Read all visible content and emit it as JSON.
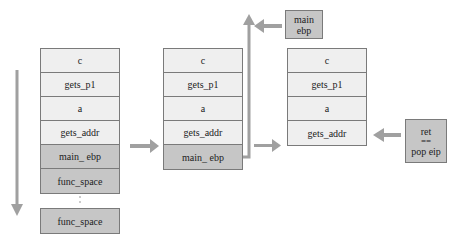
{
  "diagram": {
    "stack1": {
      "cells": [
        {
          "label": "c",
          "shade": "light"
        },
        {
          "label": "gets_p1",
          "shade": "light"
        },
        {
          "label": "a",
          "shade": "light"
        },
        {
          "label": "gets_addr",
          "shade": "light"
        },
        {
          "label": "main_ ebp",
          "shade": "dark"
        },
        {
          "label": "func_space",
          "shade": "dark"
        }
      ],
      "ellipsis": "⋮",
      "bottom_cell": "func_space"
    },
    "stack2": {
      "cells": [
        {
          "label": "c",
          "shade": "light"
        },
        {
          "label": "gets_p1",
          "shade": "light"
        },
        {
          "label": "a",
          "shade": "light"
        },
        {
          "label": "gets_addr",
          "shade": "light"
        },
        {
          "label": "main_ ebp",
          "shade": "dark"
        }
      ]
    },
    "stack3": {
      "cells": [
        {
          "label": "c",
          "shade": "light"
        },
        {
          "label": "gets_p1",
          "shade": "light"
        },
        {
          "label": "a",
          "shade": "light"
        },
        {
          "label": "gets_addr",
          "shade": "light"
        }
      ]
    },
    "popped_box": {
      "line1": "main",
      "line2": "ebp"
    },
    "ret_box": {
      "line1": "ret",
      "line2": "==",
      "line3": "pop eip"
    },
    "colors": {
      "light_cell": "#efefef",
      "dark_cell": "#c6c6c6",
      "border": "#7a7a7a",
      "arrow": "#a0a0a0"
    }
  }
}
